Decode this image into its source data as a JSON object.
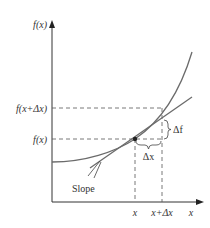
{
  "figure": {
    "type": "derivative-illustration",
    "labels": {
      "y_axis": "f(x)",
      "x_axis": "x",
      "fx_plus_dx": "f(x+Δx)",
      "fx": "f(x)",
      "delta_f": "Δf",
      "delta_x": "Δx",
      "slope": "Slope",
      "tick_x": "x",
      "tick_x_plus_dx": "x+Δx"
    },
    "colors": {
      "axis": "#333333",
      "curve": "#6b6b6b",
      "tangent": "#6b6b6b",
      "dashed": "#555555",
      "point": "#222222",
      "text": "#333333"
    }
  }
}
